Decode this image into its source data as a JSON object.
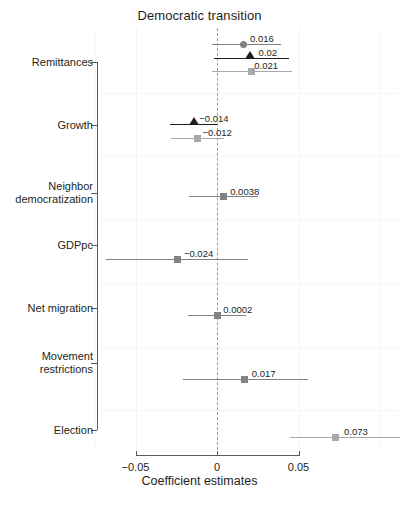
{
  "chart_data": {
    "type": "scatter",
    "title": "Democratic transition",
    "xlabel": "Coefficient estimates",
    "ylabel": "",
    "xlim": [
      -0.0745,
      0.1117
    ],
    "xticks": [
      -0.05,
      0,
      0.05
    ],
    "xticklabels": [
      "−0.05",
      "0",
      "0.05"
    ],
    "grid": true,
    "zero_reference_line": 0,
    "legend": "none",
    "categories": [
      "Remittances",
      "Growth",
      "Neighbor democratization",
      "GDPpc",
      "Net migration",
      "Movement restrictions",
      "Election"
    ],
    "colors": {
      "dark": "#231f20",
      "mid": "#808285",
      "light": "#a7a9ac",
      "zero_line": "#9b9b9b",
      "grid": "#f2f2f4",
      "axis": "#58595b"
    },
    "points": [
      {
        "category": "Remittances",
        "label": "0.016",
        "estimate": 0.016,
        "ci_low": -0.003,
        "ci_high": 0.039,
        "marker": "circle",
        "color": "#808285"
      },
      {
        "category": "Remittances",
        "label": "0.02",
        "estimate": 0.02,
        "ci_low": -0.002,
        "ci_high": 0.044,
        "marker": "triangle",
        "color": "#231f20"
      },
      {
        "category": "Remittances",
        "label": "0.021",
        "estimate": 0.021,
        "ci_low": -0.003,
        "ci_high": 0.046,
        "marker": "square",
        "color": "#a7a9ac"
      },
      {
        "category": "Growth",
        "label": "−0.014",
        "estimate": -0.014,
        "ci_low": -0.029,
        "ci_high": 0.0,
        "marker": "triangle",
        "color": "#231f20"
      },
      {
        "category": "Growth",
        "label": "−0.012",
        "estimate": -0.012,
        "ci_low": -0.028,
        "ci_high": 0.004,
        "marker": "square",
        "color": "#a7a9ac"
      },
      {
        "category": "Neighbor democratization",
        "label": "0.0038",
        "estimate": 0.0038,
        "ci_low": -0.017,
        "ci_high": 0.025,
        "marker": "square",
        "color": "#808285"
      },
      {
        "category": "GDPpc",
        "label": "−0.024",
        "estimate": -0.024,
        "ci_low": -0.068,
        "ci_high": 0.019,
        "marker": "square",
        "color": "#808285"
      },
      {
        "category": "Net migration",
        "label": "0.0002",
        "estimate": 0.0002,
        "ci_low": -0.018,
        "ci_high": 0.018,
        "marker": "square",
        "color": "#808285"
      },
      {
        "category": "Movement restrictions",
        "label": "0.017",
        "estimate": 0.017,
        "ci_low": -0.021,
        "ci_high": 0.056,
        "marker": "square",
        "color": "#808285"
      },
      {
        "category": "Election",
        "label": "0.073",
        "estimate": 0.073,
        "ci_low": 0.045,
        "ci_high": 0.112,
        "marker": "square",
        "color": "#a7a9ac"
      }
    ]
  },
  "layout": {
    "x_zero_px": 217,
    "px_per_unit": 1630,
    "panel_top_px": 28,
    "panel_bottom_px": 450,
    "y_rows_px": [
      44,
      58,
      71,
      124,
      138,
      196,
      259,
      315,
      379,
      437
    ],
    "y_category_px": [
      62,
      125,
      193,
      245,
      308,
      363,
      430
    ],
    "y_spine_x_px": 97,
    "y_spine_top_px": 62,
    "y_spine_bottom_px": 430,
    "x_axis_y_px": 455,
    "x_ticklabel_y_px": 461,
    "x_title_y_px": 481,
    "hgrid_y_px": [
      93,
      156,
      220,
      283,
      347,
      410
    ],
    "label_offsets_px": {
      "0.016": [
        7,
        -11
      ],
      "0.02": [
        9,
        -11
      ],
      "0.021": [
        3,
        -11
      ],
      "−0.014": [
        5,
        -11
      ],
      "−0.012": [
        5,
        -11
      ],
      "0.0038": [
        7,
        -10
      ],
      "−0.024": [
        6,
        -11
      ],
      "0.0002": [
        6,
        -11
      ],
      "0.017": [
        7,
        -11
      ],
      "0.073": [
        8,
        -11
      ]
    }
  }
}
